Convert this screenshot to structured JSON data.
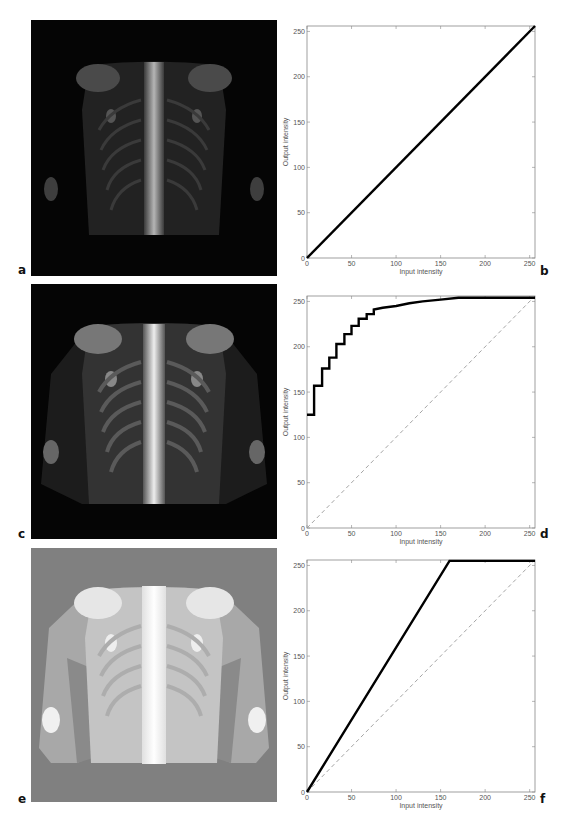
{
  "figure": {
    "panels": [
      {
        "letter": "a",
        "kind": "image",
        "description": "bone scintigram, anterior thorax, original contrast"
      },
      {
        "letter": "b",
        "kind": "chart"
      },
      {
        "letter": "c",
        "kind": "image",
        "description": "bone scintigram after histogram equalization"
      },
      {
        "letter": "d",
        "kind": "chart"
      },
      {
        "letter": "e",
        "kind": "image",
        "description": "bone scintigram after linear contrast stretch with saturation"
      },
      {
        "letter": "f",
        "kind": "chart"
      }
    ],
    "colors": {
      "curve": "#000000",
      "identity_dashed": "#9a9a9a",
      "axis": "#888888",
      "tick_text": "#555555",
      "image_bg_a": "#050505",
      "image_bg_c": "#050505",
      "image_bg_e": "#808080"
    }
  },
  "chart_data": [
    {
      "panel": "b",
      "type": "line",
      "title": "",
      "xlabel": "Input intensity",
      "ylabel": "Output intensity",
      "xlim": [
        0,
        256
      ],
      "ylim": [
        0,
        256
      ],
      "xticks": [
        0,
        50,
        100,
        150,
        200,
        250
      ],
      "yticks": [
        0,
        50,
        100,
        150,
        200,
        250
      ],
      "grid": false,
      "series": [
        {
          "name": "mapping",
          "style": "solid-thick",
          "x": [
            0,
            256
          ],
          "y": [
            0,
            256
          ]
        }
      ]
    },
    {
      "panel": "d",
      "type": "line",
      "title": "",
      "xlabel": "Input intensity",
      "ylabel": "Output intensity",
      "xlim": [
        0,
        256
      ],
      "ylim": [
        0,
        256
      ],
      "xticks": [
        0,
        50,
        100,
        150,
        200,
        250
      ],
      "yticks": [
        0,
        50,
        100,
        150,
        200,
        250
      ],
      "grid": false,
      "series": [
        {
          "name": "mapping (histogram equalization)",
          "style": "solid-thick-step",
          "x": [
            0,
            8,
            8,
            17,
            17,
            25,
            25,
            33,
            33,
            42,
            42,
            50,
            50,
            58,
            58,
            67,
            67,
            75,
            75,
            85,
            100,
            115,
            130,
            150,
            170,
            256
          ],
          "y": [
            125,
            125,
            157,
            157,
            176,
            176,
            188,
            188,
            203,
            203,
            214,
            214,
            223,
            223,
            231,
            231,
            236,
            236,
            241,
            243,
            245,
            248,
            250,
            252,
            254,
            254
          ]
        },
        {
          "name": "identity",
          "style": "dashed",
          "x": [
            0,
            256
          ],
          "y": [
            0,
            256
          ]
        }
      ]
    },
    {
      "panel": "f",
      "type": "line",
      "title": "",
      "xlabel": "Input intensity",
      "ylabel": "Output intensity",
      "xlim": [
        0,
        256
      ],
      "ylim": [
        0,
        256
      ],
      "xticks": [
        0,
        50,
        100,
        150,
        200,
        250
      ],
      "yticks": [
        0,
        50,
        100,
        150,
        200,
        250
      ],
      "grid": false,
      "series": [
        {
          "name": "mapping (linear stretch, clipped)",
          "style": "solid-thick",
          "x": [
            0,
            160,
            256
          ],
          "y": [
            0,
            255,
            255
          ]
        },
        {
          "name": "identity",
          "style": "dashed",
          "x": [
            0,
            256
          ],
          "y": [
            0,
            256
          ]
        }
      ]
    }
  ]
}
